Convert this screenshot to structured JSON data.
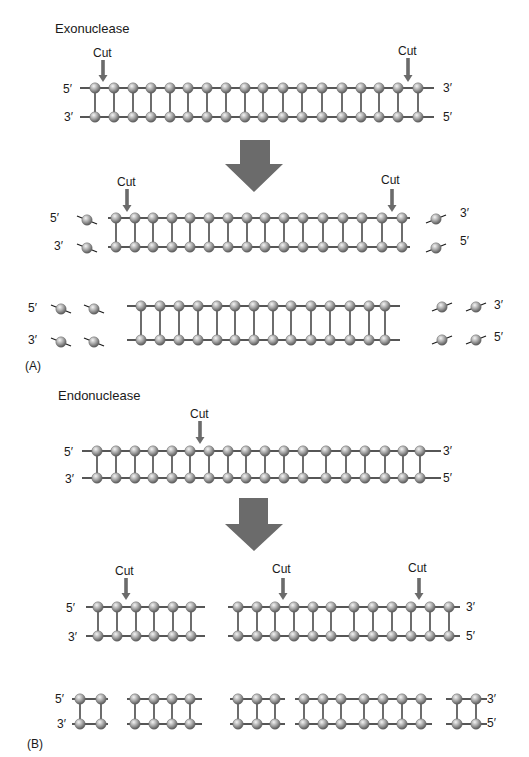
{
  "panels": {
    "A": {
      "title": "Exonuclease",
      "panel_label": "(A)",
      "cut_label": "Cut",
      "five_prime": "5′",
      "three_prime": "3′"
    },
    "B": {
      "title": "Endonuclease",
      "panel_label": "(B)",
      "cut_label": "Cut",
      "five_prime": "5′",
      "three_prime": "3′"
    }
  },
  "colors": {
    "bead": "#a8a8a8",
    "bead_highlight": "#f2f2f2",
    "bead_shadow": "#555555",
    "strand": "#1e1e1e",
    "arrow": "#6b6b6b",
    "text": "#1a1a1a"
  },
  "rows": {
    "exo_intact": {
      "top_y": 88,
      "bot_y": 117,
      "line": [
        80,
        434
      ],
      "beads": [
        95,
        114,
        133,
        151,
        170,
        188,
        207,
        226,
        245,
        263,
        283,
        302,
        322,
        342,
        361,
        379,
        398,
        418
      ],
      "cuts": [
        103,
        408
      ]
    },
    "exo_step1": {
      "top_y": 218,
      "bot_y": 247,
      "line": [
        108,
        410
      ],
      "beads": [
        116,
        135,
        153,
        172,
        190,
        209,
        228,
        247,
        265,
        284,
        303,
        323,
        343,
        362,
        382,
        402
      ],
      "cuts": [
        127,
        392
      ]
    },
    "exo_step2": {
      "top_y": 306,
      "bot_y": 340,
      "line": [
        127,
        400
      ],
      "beads": [
        141,
        160,
        179,
        198,
        217,
        235,
        254,
        273,
        291,
        311,
        330,
        350,
        369,
        385
      ]
    },
    "endo_intact": {
      "top_y": 451,
      "bot_y": 478,
      "line": [
        82,
        441
      ],
      "beads": [
        97,
        116,
        135,
        153,
        172,
        190,
        209,
        228,
        246,
        265,
        284,
        303,
        326,
        346,
        365,
        385,
        403,
        420
      ],
      "cut": 200
    },
    "endo_step1": {
      "top_y": 607,
      "bot_y": 636,
      "groups": [
        {
          "line": [
            86,
            205
          ],
          "beads": [
            98,
            117,
            136,
            154,
            173,
            191
          ]
        },
        {
          "line": [
            228,
            460
          ],
          "beads": [
            238,
            257,
            275,
            294,
            313,
            331,
            354,
            373,
            392,
            411,
            430,
            449
          ]
        }
      ],
      "cuts": [
        126,
        283,
        419
      ]
    },
    "endo_step2": {
      "top_y": 699,
      "bot_y": 724,
      "groups": [
        {
          "line": [
            72,
            108
          ],
          "beads": [
            80,
            101
          ]
        },
        {
          "line": [
            127,
            202
          ],
          "beads": [
            135,
            154,
            172,
            190
          ]
        },
        {
          "line": [
            230,
            285
          ],
          "beads": [
            238,
            257,
            275
          ]
        },
        {
          "line": [
            295,
            432
          ],
          "beads": [
            304,
            323,
            341,
            364,
            383,
            402,
            421
          ]
        },
        {
          "line": [
            446,
            487
          ],
          "beads": [
            457,
            476
          ]
        }
      ]
    }
  }
}
